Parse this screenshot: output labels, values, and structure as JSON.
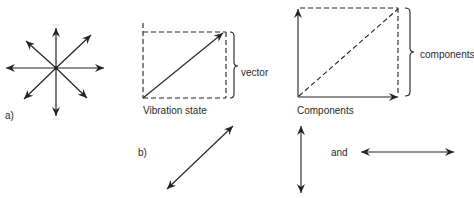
{
  "panel_a": {
    "label": "a)",
    "figure": "eight-directional-arrows"
  },
  "vibration_state": {
    "caption": "Vibration state",
    "brace_label": "vector"
  },
  "components_diagram": {
    "caption": "Components",
    "brace_label": "components"
  },
  "panel_b": {
    "label": "b)",
    "connector_word": "and"
  },
  "colors": {
    "stroke": "#222222",
    "text": "#2a2a2a",
    "background": "#ffffff"
  }
}
